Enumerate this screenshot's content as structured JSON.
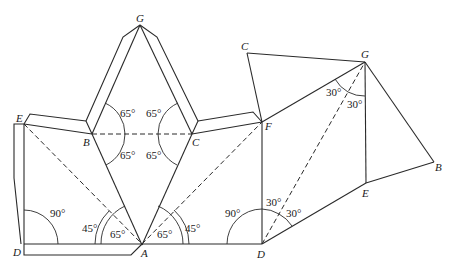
{
  "diagram": {
    "title": "",
    "point_labels": {
      "left_G": "G",
      "left_E": "E",
      "left_B": "B",
      "left_C": "C",
      "left_D": "D",
      "A": "A",
      "F": "F",
      "right_D": "D",
      "right_C": "C",
      "right_G": "G",
      "right_E": "E",
      "right_B": "B"
    },
    "angle_labels": {
      "BG_top": "65°",
      "CG_top": "65°",
      "BA_bottom": "65°",
      "CA_bottom": "65°",
      "left_D_90": "90°",
      "A_left_45": "45°",
      "A_left_65": "65°",
      "A_right_65": "65°",
      "A_right_45": "45°",
      "right_D_90": "90°",
      "right_D_30a": "30°",
      "right_D_30b": "30°",
      "G_30a": "30°",
      "G_30b": "30°"
    }
  }
}
